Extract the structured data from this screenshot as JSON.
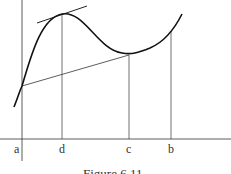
{
  "figure": {
    "caption": "Figure 6.11",
    "x_labels": [
      {
        "label": "a",
        "x": 17
      },
      {
        "label": "d",
        "x": 62
      },
      {
        "label": "c",
        "x": 129
      },
      {
        "label": "b",
        "x": 171
      }
    ],
    "elements": {
      "curve": "smooth function with local maximum at d and local minimum near c",
      "tangent_line": "horizontal-ish tangent at the maximum above d",
      "secant_line": "line from point on curve at a to point on curve at c"
    }
  }
}
